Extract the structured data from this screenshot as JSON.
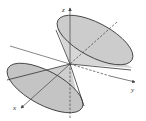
{
  "diagram": {
    "type": "double-cone-3d",
    "colors": {
      "cone_fill": "#c8c8c8",
      "cone_fill_light": "#dcdcdc",
      "stroke": "#333333",
      "axis": "#444444",
      "background": "#ffffff"
    },
    "axes": {
      "x": {
        "label": "x"
      },
      "y": {
        "label": "y"
      },
      "z": {
        "label": "z"
      }
    }
  }
}
